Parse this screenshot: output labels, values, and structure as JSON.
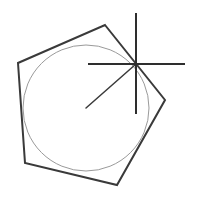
{
  "diagram": {
    "width": 207,
    "height": 204,
    "background": "#ffffff",
    "pentagon": {
      "points": "105,25 165,100 117,185 25,163 18,63",
      "stroke": "#3a3a3a",
      "stroke_width": 2
    },
    "circle": {
      "cx": 86,
      "cy": 108,
      "r": 63,
      "stroke": "#9a9a9a",
      "stroke_width": 1
    },
    "crosshair": {
      "cx": 136,
      "cy": 64,
      "vertical": {
        "x1": 136,
        "y1": 13,
        "x2": 136,
        "y2": 114
      },
      "horizontal": {
        "x1": 88,
        "y1": 64,
        "x2": 185,
        "y2": 64
      },
      "stroke": "#2e2e2e",
      "stroke_width": 2
    },
    "radius_line": {
      "x1": 136,
      "y1": 64,
      "x2": 86,
      "y2": 108,
      "stroke": "#3a3a3a",
      "stroke_width": 1.5
    }
  }
}
